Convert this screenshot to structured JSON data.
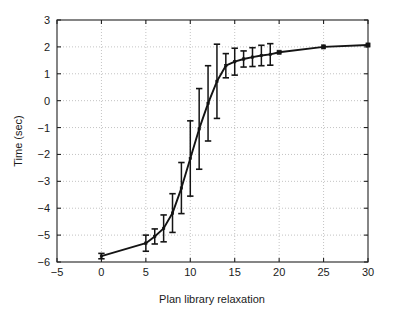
{
  "chart_data": {
    "type": "line",
    "title": "",
    "subtitle": "",
    "xlabel": "Plan library relaxation",
    "ylabel": "Time (sec)",
    "xlim": [
      -5,
      30
    ],
    "ylim": [
      -6,
      3
    ],
    "xticks": [
      -5,
      0,
      5,
      10,
      15,
      20,
      25,
      30
    ],
    "xtick_labels": [
      "−5",
      "0",
      "5",
      "10",
      "15",
      "20",
      "25",
      "30"
    ],
    "yticks": [
      -6,
      -5,
      -4,
      -3,
      -2,
      -1,
      0,
      1,
      2,
      3
    ],
    "ytick_labels": [
      "−6",
      "−5",
      "−4",
      "−3",
      "−2",
      "−1",
      "0",
      "1",
      "2",
      "3"
    ],
    "grid": true,
    "grid_style": "dotted",
    "grid_color": "#b4b4b4",
    "legend": null,
    "legend_position": "none",
    "marker": "square",
    "line_color": "#141414",
    "error_bars": true,
    "x": [
      0,
      5,
      6,
      7,
      8,
      9,
      10,
      11,
      12,
      13,
      14,
      15,
      16,
      17,
      18,
      19,
      20,
      25,
      30
    ],
    "y": [
      -5.78,
      -5.3,
      -5.05,
      -4.75,
      -4.18,
      -3.25,
      -2.15,
      -1.05,
      -0.1,
      0.72,
      1.3,
      1.45,
      1.55,
      1.62,
      1.68,
      1.72,
      1.8,
      2.0,
      2.07
    ],
    "yerr_lower": [
      0.1,
      0.3,
      0.28,
      0.5,
      0.72,
      0.95,
      1.4,
      1.5,
      1.4,
      1.38,
      0.45,
      0.5,
      0.3,
      0.35,
      0.38,
      0.4,
      0,
      0,
      0
    ],
    "yerr_upper": [
      0.08,
      0.3,
      0.28,
      0.5,
      0.72,
      0.95,
      1.4,
      1.5,
      1.4,
      1.38,
      0.45,
      0.5,
      0.3,
      0.35,
      0.38,
      0.4,
      0,
      0,
      0
    ],
    "series": [
      {
        "name": "Time vs plan library relaxation",
        "points": [
          {
            "x": 0,
            "y": -5.78,
            "err": 0.1
          },
          {
            "x": 5,
            "y": -5.3,
            "err": 0.3
          },
          {
            "x": 6,
            "y": -5.05,
            "err": 0.28
          },
          {
            "x": 7,
            "y": -4.75,
            "err": 0.5
          },
          {
            "x": 8,
            "y": -4.18,
            "err": 0.72
          },
          {
            "x": 9,
            "y": -3.25,
            "err": 0.95
          },
          {
            "x": 10,
            "y": -2.15,
            "err": 1.4
          },
          {
            "x": 11,
            "y": -1.05,
            "err": 1.5
          },
          {
            "x": 12,
            "y": -0.1,
            "err": 1.4
          },
          {
            "x": 13,
            "y": 0.72,
            "err": 1.38
          },
          {
            "x": 14,
            "y": 1.3,
            "err": 0.45
          },
          {
            "x": 15,
            "y": 1.45,
            "err": 0.5
          },
          {
            "x": 16,
            "y": 1.55,
            "err": 0.3
          },
          {
            "x": 17,
            "y": 1.62,
            "err": 0.35
          },
          {
            "x": 18,
            "y": 1.68,
            "err": 0.38
          },
          {
            "x": 19,
            "y": 1.72,
            "err": 0.4
          },
          {
            "x": 20,
            "y": 1.8,
            "err": 0.0
          },
          {
            "x": 25,
            "y": 2.0,
            "err": 0.0
          },
          {
            "x": 30,
            "y": 2.07,
            "err": 0.0
          }
        ]
      }
    ]
  }
}
